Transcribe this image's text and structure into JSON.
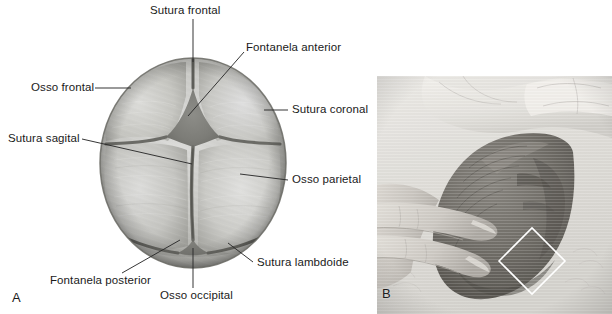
{
  "figure": {
    "panels": [
      {
        "letter": "A",
        "kind": "illustration",
        "description": "Superior (top-down) view of a neonatal skull showing cranial bones, sutures and fontanelles"
      },
      {
        "letter": "B",
        "kind": "photograph",
        "description": "Clinician's fingers palpating the anterior fontanelle of a newborn infant; the fontanelle is outlined with a white diamond"
      }
    ]
  },
  "panel_a": {
    "letter": "A",
    "labels": [
      {
        "id": "sutura-frontal",
        "text": "Sutura frontal"
      },
      {
        "id": "fontanela-anterior",
        "text": "Fontanela anterior"
      },
      {
        "id": "osso-frontal",
        "text": "Osso frontal"
      },
      {
        "id": "sutura-coronal",
        "text": "Sutura coronal"
      },
      {
        "id": "sutura-sagital",
        "text": "Sutura sagital"
      },
      {
        "id": "osso-parietal",
        "text": "Osso parietal"
      },
      {
        "id": "sutura-lambdoide",
        "text": "Sutura lambdoide"
      },
      {
        "id": "fontanela-posterior",
        "text": "Fontanela posterior"
      },
      {
        "id": "osso-occipital",
        "text": "Osso occipital"
      }
    ],
    "colors": {
      "bone_light": "#d2d2ce",
      "bone_mid": "#b5b5b0",
      "bone_dark": "#8e8e89",
      "suture": "#6f6f6a",
      "outline": "#55554f",
      "leader_line": "#2b2b2b",
      "text": "#1a1a1a",
      "background": "#ffffff"
    }
  },
  "panel_b": {
    "letter": "B",
    "marker": {
      "shape": "diamond",
      "color": "#ffffff"
    },
    "colors": {
      "photo_light": "#e2e1dd",
      "photo_mid": "#bcbbb6",
      "head_dark": "#6d6b67",
      "head_darker": "#57554f",
      "skin_mid": "#c9c7c1",
      "background": "#ffffff"
    }
  }
}
